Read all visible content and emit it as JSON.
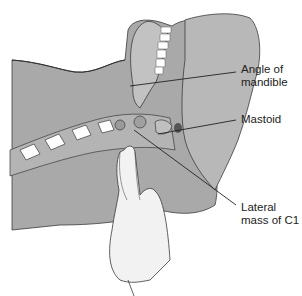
{
  "figure": {
    "colors": {
      "tissue": "#a9a9a9",
      "tissue_light": "#c6c6c6",
      "bone": "#b4b4b4",
      "bone_dark": "#8e8e8e",
      "outline": "#3a3a3a",
      "skin_hand": "#f2f2f2",
      "teeth": "#ffffff",
      "leader": "#222222"
    }
  },
  "labels": [
    {
      "id": "angle-of-mandible",
      "line1": "Angle of",
      "line2": "mandible"
    },
    {
      "id": "mastoid",
      "line1": "Mastoid",
      "line2": ""
    },
    {
      "id": "lateral-mass-c1",
      "line1": "Lateral",
      "line2": "mass of C1"
    }
  ]
}
